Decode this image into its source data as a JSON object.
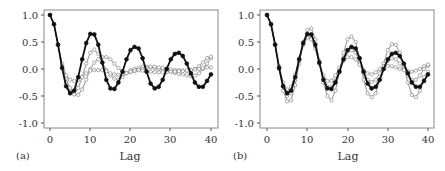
{
  "chart_data": [
    {
      "type": "line",
      "panel_label": "(a)",
      "xlabel": "Lag",
      "ylabel": "",
      "xlim": [
        0,
        40
      ],
      "ylim": [
        -1.0,
        1.0
      ],
      "xticks": [
        0,
        10,
        20,
        30,
        40
      ],
      "yticks": [
        1.0,
        0.5,
        0.0,
        -0.5,
        -1.0
      ],
      "ytick_labels": [
        "1.0",
        "0.5",
        "0.0",
        "-0.5",
        "-1.0"
      ],
      "grid": false,
      "legend": null,
      "x": [
        0,
        1,
        2,
        3,
        4,
        5,
        6,
        7,
        8,
        9,
        10,
        11,
        12,
        13,
        14,
        15,
        16,
        17,
        18,
        19,
        20,
        21,
        22,
        23,
        24,
        25,
        26,
        27,
        28,
        29,
        30,
        31,
        32,
        33,
        34,
        35,
        36,
        37,
        38,
        39,
        40
      ],
      "series": [
        {
          "name": "observed",
          "color": "#111111",
          "marker": "filled-circle",
          "values": [
            1.0,
            0.83,
            0.45,
            0.02,
            -0.32,
            -0.45,
            -0.4,
            -0.15,
            0.18,
            0.48,
            0.65,
            0.64,
            0.45,
            0.12,
            -0.2,
            -0.36,
            -0.37,
            -0.25,
            -0.05,
            0.18,
            0.35,
            0.41,
            0.38,
            0.2,
            -0.05,
            -0.27,
            -0.36,
            -0.33,
            -0.2,
            0.0,
            0.18,
            0.28,
            0.3,
            0.24,
            0.1,
            -0.08,
            -0.25,
            -0.33,
            -0.33,
            -0.22,
            -0.1
          ]
        },
        {
          "name": "model-1",
          "color": "#888888",
          "marker": "open-circle",
          "values": [
            1.0,
            0.83,
            0.45,
            0.05,
            -0.25,
            -0.42,
            -0.45,
            -0.35,
            -0.15,
            0.1,
            0.3,
            0.36,
            0.28,
            0.12,
            -0.02,
            -0.12,
            -0.18,
            -0.2,
            -0.15,
            -0.08,
            -0.02,
            0.0,
            0.02,
            0.04,
            0.04,
            0.03,
            0.02,
            0.0,
            -0.02,
            -0.04,
            -0.05,
            -0.07,
            -0.09,
            -0.1,
            -0.12,
            -0.13,
            -0.12,
            -0.08,
            0.0,
            0.1,
            0.2
          ]
        },
        {
          "name": "model-2",
          "color": "#888888",
          "marker": "open-circle",
          "values": [
            1.0,
            0.83,
            0.45,
            0.08,
            -0.18,
            -0.35,
            -0.47,
            -0.48,
            -0.38,
            -0.2,
            0.0,
            0.12,
            0.18,
            0.22,
            0.22,
            0.18,
            0.1,
            0.02,
            -0.04,
            -0.07,
            -0.06,
            -0.04,
            -0.02,
            0.0,
            0.02,
            0.04,
            0.04,
            0.03,
            0.02,
            0.0,
            -0.01,
            -0.02,
            -0.02,
            -0.03,
            -0.03,
            -0.02,
            0.0,
            0.05,
            0.12,
            0.2,
            0.23
          ]
        },
        {
          "name": "model-3",
          "color": "#888888",
          "marker": "open-circle",
          "values": [
            1.0,
            0.83,
            0.45,
            0.1,
            -0.12,
            -0.2,
            -0.22,
            -0.2,
            -0.15,
            -0.08,
            -0.03,
            -0.02,
            -0.02,
            -0.02,
            -0.04,
            -0.08,
            -0.1,
            -0.11,
            -0.1,
            -0.08,
            -0.05,
            -0.03,
            -0.02,
            -0.03,
            -0.04,
            -0.05,
            -0.06,
            -0.06,
            -0.06,
            -0.06,
            -0.05,
            -0.05,
            -0.04,
            -0.04,
            -0.03,
            -0.02,
            -0.01,
            0.0,
            0.02,
            0.03,
            0.03
          ]
        }
      ]
    },
    {
      "type": "line",
      "panel_label": "(b)",
      "xlabel": "Lag",
      "ylabel": "",
      "xlim": [
        0,
        40
      ],
      "ylim": [
        -1.0,
        1.0
      ],
      "xticks": [
        0,
        10,
        20,
        30,
        40
      ],
      "yticks": [
        1.0,
        0.5,
        0.0,
        -0.5,
        -1.0
      ],
      "ytick_labels": [
        "1.0",
        "0.5",
        "0.0",
        "-0.5",
        "-1.0"
      ],
      "grid": false,
      "legend": null,
      "x": [
        0,
        1,
        2,
        3,
        4,
        5,
        6,
        7,
        8,
        9,
        10,
        11,
        12,
        13,
        14,
        15,
        16,
        17,
        18,
        19,
        20,
        21,
        22,
        23,
        24,
        25,
        26,
        27,
        28,
        29,
        30,
        31,
        32,
        33,
        34,
        35,
        36,
        37,
        38,
        39,
        40
      ],
      "series": [
        {
          "name": "observed",
          "color": "#111111",
          "marker": "filled-circle",
          "values": [
            1.0,
            0.83,
            0.45,
            0.02,
            -0.32,
            -0.45,
            -0.4,
            -0.15,
            0.18,
            0.48,
            0.65,
            0.64,
            0.45,
            0.12,
            -0.2,
            -0.36,
            -0.37,
            -0.25,
            -0.05,
            0.18,
            0.35,
            0.41,
            0.38,
            0.2,
            -0.05,
            -0.27,
            -0.36,
            -0.33,
            -0.2,
            0.0,
            0.18,
            0.28,
            0.3,
            0.24,
            0.1,
            -0.08,
            -0.25,
            -0.33,
            -0.33,
            -0.22,
            -0.1
          ]
        },
        {
          "name": "model-1",
          "color": "#888888",
          "marker": "open-circle",
          "values": [
            1.0,
            0.83,
            0.45,
            0.0,
            -0.4,
            -0.6,
            -0.58,
            -0.3,
            0.1,
            0.5,
            0.72,
            0.75,
            0.55,
            0.15,
            -0.25,
            -0.5,
            -0.58,
            -0.4,
            -0.05,
            0.3,
            0.55,
            0.6,
            0.5,
            0.2,
            -0.2,
            -0.45,
            -0.52,
            -0.45,
            -0.2,
            0.1,
            0.35,
            0.46,
            0.45,
            0.3,
            0.05,
            -0.25,
            -0.48,
            -0.52,
            -0.4,
            -0.15,
            -0.05
          ]
        },
        {
          "name": "model-2",
          "color": "#888888",
          "marker": "open-circle",
          "values": [
            1.0,
            0.83,
            0.45,
            0.02,
            -0.32,
            -0.5,
            -0.45,
            -0.2,
            0.15,
            0.45,
            0.6,
            0.58,
            0.4,
            0.1,
            -0.18,
            -0.32,
            -0.33,
            -0.22,
            -0.02,
            0.2,
            0.32,
            0.35,
            0.3,
            0.12,
            -0.08,
            -0.2,
            -0.24,
            -0.2,
            -0.08,
            0.05,
            0.15,
            0.2,
            0.18,
            0.1,
            0.0,
            -0.12,
            -0.2,
            -0.2,
            -0.12,
            0.0,
            0.06
          ]
        },
        {
          "name": "model-3",
          "color": "#888888",
          "marker": "open-circle",
          "values": [
            1.0,
            0.83,
            0.45,
            0.05,
            -0.25,
            -0.38,
            -0.33,
            -0.1,
            0.2,
            0.45,
            0.58,
            0.55,
            0.38,
            0.1,
            -0.12,
            -0.22,
            -0.22,
            -0.12,
            0.02,
            0.15,
            0.22,
            0.22,
            0.18,
            0.08,
            -0.02,
            -0.08,
            -0.1,
            -0.06,
            0.0,
            0.05,
            0.06,
            0.05,
            0.03,
            0.0,
            -0.02,
            -0.04,
            -0.05,
            -0.03,
            0.0,
            0.05,
            0.08
          ]
        }
      ]
    }
  ],
  "panels": [
    {
      "label": "(a)",
      "xlabel": "Lag",
      "xtick_labels": [
        "0",
        "10",
        "20",
        "30",
        "40"
      ],
      "ytick_labels": [
        "1.0",
        "0.5",
        "0.0",
        "-0.5",
        "-1.0"
      ]
    },
    {
      "label": "(b)",
      "xlabel": "Lag",
      "xtick_labels": [
        "0",
        "10",
        "20",
        "30",
        "40"
      ],
      "ytick_labels": [
        "1.0",
        "0.5",
        "0.0",
        "-0.5",
        "-1.0"
      ]
    }
  ]
}
